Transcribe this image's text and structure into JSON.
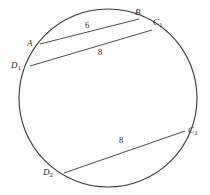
{
  "figure": {
    "kind": "circle-with-three-chords",
    "canvas": {
      "width": 210,
      "height": 195
    },
    "background_color": "#fdfdfc",
    "stroke_color": "#3a3a3a",
    "text_color": "#2b2b2b",
    "circle": {
      "cx": 108,
      "cy": 98,
      "r": 89
    },
    "points": [
      {
        "id": "A",
        "letter": "A",
        "sub": "",
        "x": 40,
        "y": 44,
        "label_x": 27,
        "label_y": 39
      },
      {
        "id": "B",
        "letter": "B",
        "sub": "",
        "x": 139,
        "y": 19,
        "label_x": 135,
        "label_y": 8
      },
      {
        "id": "C1",
        "letter": "C",
        "sub": "1",
        "x": 152,
        "y": 30,
        "label_x": 153,
        "label_y": 18
      },
      {
        "id": "D1",
        "letter": "D",
        "sub": "1",
        "x": 30,
        "y": 66,
        "label_x": 11,
        "label_y": 61
      },
      {
        "id": "C2",
        "letter": "C",
        "sub": "2",
        "x": 185,
        "y": 131,
        "label_x": 188,
        "label_y": 126
      },
      {
        "id": "D2",
        "letter": "D",
        "sub": "2",
        "x": 64,
        "y": 173,
        "label_x": 43,
        "label_y": 168
      }
    ],
    "chords": [
      {
        "id": "AB",
        "from": "A",
        "to": "B",
        "length_label": "6",
        "label_x": 85,
        "label_y": 21
      },
      {
        "id": "D1C1",
        "from": "D1",
        "to": "C1",
        "length_label": "8",
        "label_x": 98,
        "label_y": 48
      },
      {
        "id": "D2C2",
        "from": "D2",
        "to": "C2",
        "length_label": "8",
        "label_x": 119,
        "label_y": 136
      }
    ]
  }
}
